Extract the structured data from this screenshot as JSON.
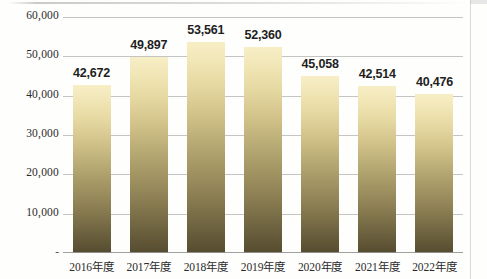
{
  "chart_data": {
    "type": "bar",
    "title": "",
    "xlabel": "",
    "ylabel": "",
    "categories": [
      "2016年度",
      "2017年度",
      "2018年度",
      "2019年度",
      "2020年度",
      "2021年度",
      "2022年度"
    ],
    "values": [
      42672,
      49897,
      53561,
      52360,
      45058,
      42514,
      40476
    ],
    "value_labels": [
      "42,672",
      "49,897",
      "53,561",
      "52,360",
      "45,058",
      "42,514",
      "40,476"
    ],
    "ylim": [
      0,
      60000
    ],
    "y_tick_values": [
      0,
      10000,
      20000,
      30000,
      40000,
      50000,
      60000
    ],
    "y_tick_labels": [
      "-",
      "10,000",
      "20,000",
      "30,000",
      "40,000",
      "50,000",
      "60,000"
    ],
    "grid": true,
    "legend": false,
    "legend_position": "none",
    "series": [
      {
        "name": "",
        "values": [
          42672,
          49897,
          53561,
          52360,
          45058,
          42514,
          40476
        ]
      }
    ],
    "bar_gradient_top_color": "#f7eec6",
    "bar_gradient_bottom_color": "#554b30",
    "gridline_color": "#b0b0b0",
    "label_color": "#1f1f1f",
    "axis_text_color": "#2b2b2b",
    "background_color": "#fefefd"
  }
}
